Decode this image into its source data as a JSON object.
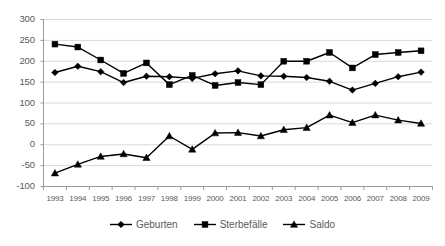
{
  "chart_data": {
    "type": "line",
    "title": "",
    "subtitle": "",
    "xlabel": "",
    "ylabel": "",
    "categories": [
      "1993",
      "1994",
      "1995",
      "1996",
      "1997",
      "1998",
      "1999",
      "2000",
      "2001",
      "2002",
      "2003",
      "2004",
      "2005",
      "2006",
      "2007",
      "2008",
      "2009"
    ],
    "series": [
      {
        "name": "Geburten",
        "marker": "diamond",
        "color": "#000000",
        "values": [
          173,
          188,
          175,
          149,
          164,
          163,
          159,
          170,
          177,
          165,
          164,
          161,
          152,
          131,
          147,
          163,
          174
        ]
      },
      {
        "name": "Sterbefälle",
        "marker": "square",
        "color": "#000000",
        "values": [
          241,
          234,
          203,
          171,
          196,
          144,
          166,
          142,
          149,
          144,
          200,
          200,
          221,
          184,
          216,
          221,
          225
        ]
      },
      {
        "name": "Saldo",
        "marker": "triangle",
        "color": "#000000",
        "values": [
          -68,
          -47,
          -28,
          -22,
          -31,
          21,
          -11,
          28,
          29,
          21,
          36,
          41,
          71,
          53,
          71,
          59,
          51
        ]
      }
    ],
    "ylim": [
      -100,
      300
    ],
    "ytick_values": [
      300,
      250,
      200,
      150,
      100,
      50,
      0,
      -50,
      -100
    ],
    "ytick_labels": [
      "300",
      "250",
      "200",
      "150",
      "100",
      "50",
      "0",
      "-50",
      "-100"
    ],
    "grid": true,
    "grid_color": "#d9d9d9",
    "axis_color": "#9a9a9a",
    "legend_position": "bottom",
    "background": "#ffffff"
  },
  "legend": {
    "items": [
      {
        "label": "Geburten",
        "marker": "diamond"
      },
      {
        "label": "Sterbefälle",
        "marker": "square"
      },
      {
        "label": "Saldo",
        "marker": "triangle"
      }
    ]
  }
}
